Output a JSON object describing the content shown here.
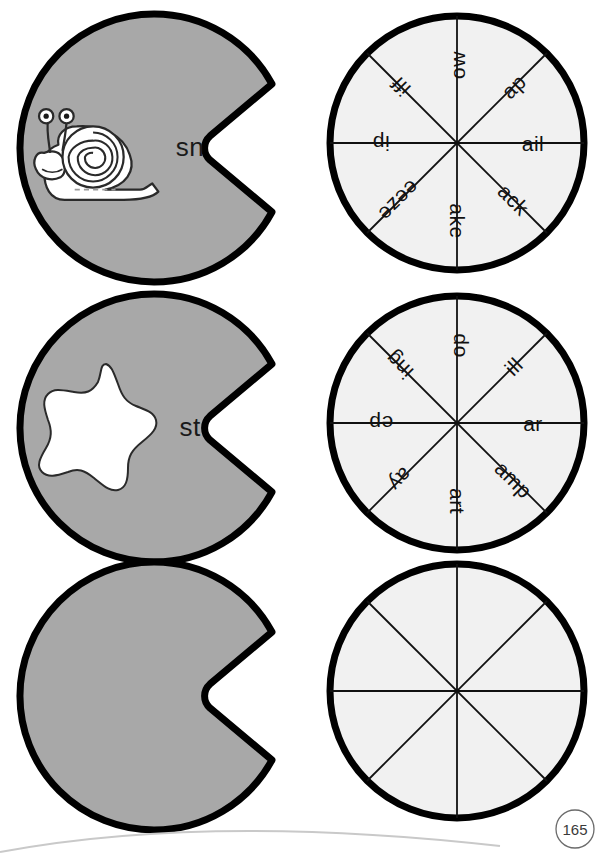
{
  "page": {
    "number": "165",
    "background_color": "#ffffff"
  },
  "colors": {
    "lilypad_fill": "#a8a8a8",
    "lilypad_outline": "#000000",
    "wheel_fill": "#f1f1f1",
    "wheel_outline": "#000000",
    "spoke_line": "#111111",
    "cutout_fill": "#ffffff",
    "text_color": "#111111"
  },
  "rows": [
    {
      "index": 1,
      "pad": {
        "label": "sn",
        "icon": "snail-icon",
        "icon_label": "snail",
        "has_icon": true
      },
      "wheel": {
        "segments": [
          {
            "label": "ail",
            "angle_deg": 0
          },
          {
            "label": "ack",
            "angle_deg": 45
          },
          {
            "label": "ake",
            "angle_deg": 90
          },
          {
            "label": "eeze",
            "angle_deg": 135
          },
          {
            "label": "ip",
            "angle_deg": 180
          },
          {
            "label": "iff",
            "angle_deg": 225
          },
          {
            "label": "ow",
            "angle_deg": 270
          },
          {
            "label": "ap",
            "angle_deg": 315
          }
        ]
      }
    },
    {
      "index": 2,
      "pad": {
        "label": "st",
        "icon": "star-icon",
        "icon_label": "star",
        "has_icon": true
      },
      "wheel": {
        "segments": [
          {
            "label": "ar",
            "angle_deg": 0
          },
          {
            "label": "amp",
            "angle_deg": 45
          },
          {
            "label": "art",
            "angle_deg": 90
          },
          {
            "label": "ay",
            "angle_deg": 135
          },
          {
            "label": "ep",
            "angle_deg": 180
          },
          {
            "label": "ing",
            "angle_deg": 225
          },
          {
            "label": "op",
            "angle_deg": 270
          },
          {
            "label": "ill",
            "angle_deg": 315
          }
        ]
      }
    },
    {
      "index": 3,
      "pad": {
        "label": "",
        "icon": "",
        "icon_label": "",
        "has_icon": false
      },
      "wheel": {
        "segments": [
          {
            "label": "",
            "angle_deg": 0
          },
          {
            "label": "",
            "angle_deg": 45
          },
          {
            "label": "",
            "angle_deg": 90
          },
          {
            "label": "",
            "angle_deg": 135
          },
          {
            "label": "",
            "angle_deg": 180
          },
          {
            "label": "",
            "angle_deg": 225
          },
          {
            "label": "",
            "angle_deg": 270
          },
          {
            "label": "",
            "angle_deg": 315
          }
        ]
      }
    }
  ]
}
